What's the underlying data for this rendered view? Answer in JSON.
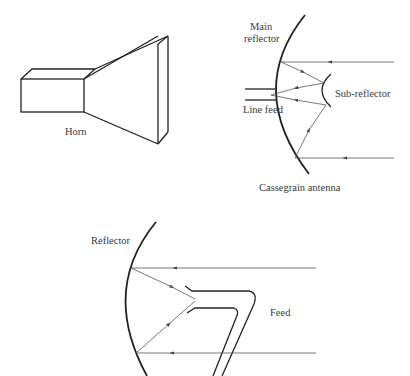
{
  "diagrams": {
    "horn": {
      "label": "Horn"
    },
    "cassegrain": {
      "title": "Cassegrain antenna",
      "main_reflector_label_line1": "Main",
      "main_reflector_label_line2": "reflector",
      "sub_reflector_label": "Sub-reflector",
      "line_feed_label": "Line feed"
    },
    "offset_feed": {
      "reflector_label": "Reflector",
      "feed_label": "Feed"
    }
  },
  "colors": {
    "line": "#222222",
    "ray": "#555555",
    "text": "#3a3a3a",
    "background": "#ffffff"
  }
}
